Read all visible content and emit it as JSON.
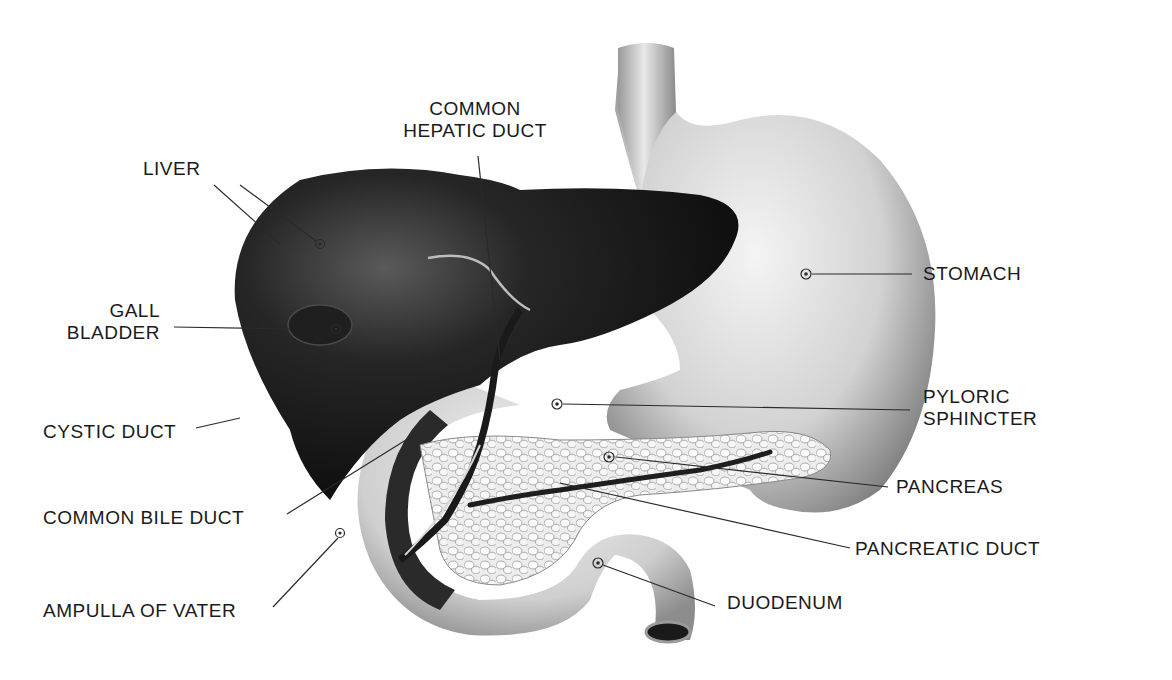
{
  "diagram": {
    "title": "",
    "colors": {
      "background": "#ffffff",
      "label_text": "#1a1a1a",
      "leader_line": "#2a2a2a",
      "liver": "#141414",
      "stomach": "#d4d4d4",
      "pancreas": "#e6e6e6",
      "duodenum": "#cfcfcf",
      "ducts": "#1e1e1e"
    },
    "labels": {
      "common_hepatic_duct": {
        "line1": "COMMON",
        "line2": "HEPATIC DUCT"
      },
      "liver": {
        "text": "LIVER"
      },
      "gall_bladder": {
        "line1": "GALL",
        "line2": "BLADDER"
      },
      "cystic_duct": {
        "text": "CYSTIC DUCT"
      },
      "common_bile_duct": {
        "text": "COMMON BILE DUCT"
      },
      "ampulla_of_vater": {
        "text": "AMPULLA OF VATER"
      },
      "stomach": {
        "text": "STOMACH"
      },
      "pyloric_sphincter": {
        "line1": "PYLORIC",
        "line2": "SPHINCTER"
      },
      "pancreas": {
        "text": "PANCREAS"
      },
      "pancreatic_duct": {
        "text": "PANCREATIC DUCT"
      },
      "duodenum": {
        "text": "DUODENUM"
      }
    }
  }
}
